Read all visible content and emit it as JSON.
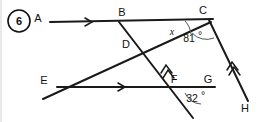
{
  "figure": {
    "number_badge": "6",
    "width": 261,
    "height": 122
  },
  "points": {
    "A": {
      "label": "A",
      "x": 38,
      "y": 18
    },
    "B": {
      "label": "B",
      "x": 122,
      "y": 16
    },
    "C": {
      "label": "C",
      "x": 203,
      "y": 14
    },
    "D": {
      "label": "D",
      "x": 126,
      "y": 45
    },
    "E": {
      "label": "E",
      "x": 44,
      "y": 80
    },
    "F": {
      "label": "F",
      "x": 174,
      "y": 79
    },
    "G": {
      "label": "G",
      "x": 208,
      "y": 79
    },
    "H": {
      "label": "H",
      "x": 245,
      "y": 108
    }
  },
  "angles": [
    {
      "id": "angle-x",
      "label": "x",
      "vertex": "C",
      "x": 170,
      "y": 33,
      "italic": true
    },
    {
      "id": "angle-81",
      "label": "81",
      "degree": "°",
      "vertex": "C",
      "x": 185,
      "y": 38
    },
    {
      "id": "angle-32",
      "label": "32",
      "degree": "°",
      "vertex": "F",
      "x": 190,
      "y": 99
    }
  ],
  "lines": [
    {
      "id": "line-AC",
      "from": "A",
      "to": "C",
      "marks": 1,
      "description": "horizontal ray through B to C"
    },
    {
      "id": "line-EG",
      "from": "E",
      "to": "G",
      "marks": 1,
      "description": "lower horizontal line through F to G"
    },
    {
      "id": "line-BF",
      "from": "B",
      "to": "F",
      "marks": 2,
      "description": "transversal from B through D to F and beyond"
    },
    {
      "id": "line-CH",
      "from": "C",
      "to": "H",
      "marks": 2,
      "description": "transversal from C down to H"
    },
    {
      "id": "line-EC",
      "from": "E",
      "to": "C",
      "marks": 0,
      "description": "slanted line from lower-left through D up to C"
    }
  ],
  "colors": {
    "stroke": "#1a1a1a",
    "arc": "#555555",
    "text": "#111111",
    "background": "#ffffff"
  }
}
